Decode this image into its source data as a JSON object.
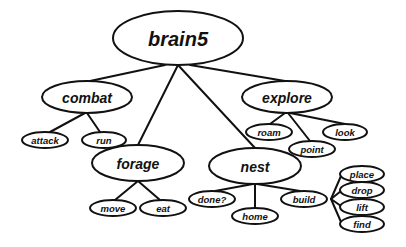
{
  "diagram": {
    "type": "tree",
    "title": "brain5",
    "colors": {
      "stroke": "#111111",
      "fill": "#ffffff",
      "background": "#ffffff"
    },
    "nodes": [
      {
        "id": "brain5",
        "label": "brain5",
        "level": 0,
        "cx": 178,
        "cy": 38,
        "rx": 65,
        "ry": 27
      },
      {
        "id": "combat",
        "label": "combat",
        "level": 1,
        "cx": 87,
        "cy": 97,
        "rx": 45,
        "ry": 16
      },
      {
        "id": "explore",
        "label": "explore",
        "level": 1,
        "cx": 287,
        "cy": 97,
        "rx": 45,
        "ry": 16
      },
      {
        "id": "forage",
        "label": "forage",
        "level": 1,
        "cx": 138,
        "cy": 163,
        "rx": 46,
        "ry": 18
      },
      {
        "id": "nest",
        "label": "nest",
        "level": 1,
        "cx": 255,
        "cy": 166,
        "rx": 46,
        "ry": 18
      },
      {
        "id": "attack",
        "label": "attack",
        "level": 2,
        "cx": 45,
        "cy": 140,
        "rx": 23,
        "ry": 8
      },
      {
        "id": "run",
        "label": "run",
        "level": 2,
        "cx": 104,
        "cy": 140,
        "rx": 22,
        "ry": 8
      },
      {
        "id": "roam",
        "label": "roam",
        "level": 2,
        "cx": 269,
        "cy": 132,
        "rx": 23,
        "ry": 8
      },
      {
        "id": "point",
        "label": "point",
        "level": 2,
        "cx": 312,
        "cy": 149,
        "rx": 23,
        "ry": 8
      },
      {
        "id": "look",
        "label": "look",
        "level": 2,
        "cx": 345,
        "cy": 132,
        "rx": 22,
        "ry": 8
      },
      {
        "id": "move",
        "label": "move",
        "level": 2,
        "cx": 113,
        "cy": 208,
        "rx": 23,
        "ry": 8
      },
      {
        "id": "eat",
        "label": "eat",
        "level": 2,
        "cx": 163,
        "cy": 208,
        "rx": 23,
        "ry": 8
      },
      {
        "id": "done",
        "label": "done?",
        "level": 2,
        "cx": 212,
        "cy": 199,
        "rx": 23,
        "ry": 8
      },
      {
        "id": "home",
        "label": "home",
        "level": 2,
        "cx": 255,
        "cy": 216,
        "rx": 23,
        "ry": 8
      },
      {
        "id": "build",
        "label": "build",
        "level": 2,
        "cx": 304,
        "cy": 199,
        "rx": 23,
        "ry": 8
      },
      {
        "id": "place",
        "label": "place",
        "level": 2,
        "cx": 362,
        "cy": 174,
        "rx": 22,
        "ry": 8
      },
      {
        "id": "drop",
        "label": "drop",
        "level": 2,
        "cx": 362,
        "cy": 190,
        "rx": 22,
        "ry": 8
      },
      {
        "id": "lift",
        "label": "lift",
        "level": 2,
        "cx": 362,
        "cy": 207,
        "rx": 22,
        "ry": 8
      },
      {
        "id": "find",
        "label": "find",
        "level": 2,
        "cx": 362,
        "cy": 224,
        "rx": 22,
        "ry": 8
      }
    ],
    "edges": [
      {
        "from": "brain5",
        "to": "combat",
        "x1": 165,
        "y1": 65,
        "x2": 90,
        "y2": 81
      },
      {
        "from": "brain5",
        "to": "explore",
        "x1": 190,
        "y1": 65,
        "x2": 285,
        "y2": 81
      },
      {
        "from": "brain5",
        "to": "forage",
        "x1": 178,
        "y1": 65,
        "x2": 138,
        "y2": 145
      },
      {
        "from": "brain5",
        "to": "nest",
        "x1": 178,
        "y1": 65,
        "x2": 255,
        "y2": 148
      },
      {
        "from": "combat",
        "to": "attack",
        "x1": 85,
        "y1": 113,
        "x2": 50,
        "y2": 132
      },
      {
        "from": "combat",
        "to": "run",
        "x1": 87,
        "y1": 113,
        "x2": 100,
        "y2": 132
      },
      {
        "from": "explore",
        "to": "roam",
        "x1": 285,
        "y1": 113,
        "x2": 270,
        "y2": 124
      },
      {
        "from": "explore",
        "to": "point",
        "x1": 288,
        "y1": 113,
        "x2": 310,
        "y2": 141
      },
      {
        "from": "explore",
        "to": "look",
        "x1": 290,
        "y1": 113,
        "x2": 345,
        "y2": 124
      },
      {
        "from": "forage",
        "to": "move",
        "x1": 138,
        "y1": 181,
        "x2": 115,
        "y2": 200
      },
      {
        "from": "forage",
        "to": "eat",
        "x1": 138,
        "y1": 181,
        "x2": 160,
        "y2": 200
      },
      {
        "from": "nest",
        "to": "done",
        "x1": 253,
        "y1": 184,
        "x2": 215,
        "y2": 191
      },
      {
        "from": "nest",
        "to": "home",
        "x1": 255,
        "y1": 184,
        "x2": 255,
        "y2": 208
      },
      {
        "from": "nest",
        "to": "build",
        "x1": 257,
        "y1": 184,
        "x2": 300,
        "y2": 191
      },
      {
        "from": "build",
        "to": "place",
        "x1": 331,
        "y1": 199,
        "x2": 341,
        "y2": 176
      },
      {
        "from": "build",
        "to": "drop",
        "x1": 331,
        "y1": 199,
        "x2": 341,
        "y2": 191
      },
      {
        "from": "build",
        "to": "lift",
        "x1": 331,
        "y1": 199,
        "x2": 341,
        "y2": 206
      },
      {
        "from": "build",
        "to": "find",
        "x1": 331,
        "y1": 199,
        "x2": 341,
        "y2": 222
      }
    ]
  }
}
